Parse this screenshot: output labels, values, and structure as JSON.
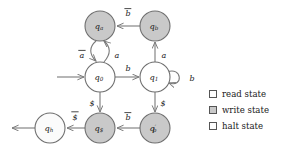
{
  "diagram": {
    "type": "state-transition-diagram",
    "title": "",
    "states": [
      {
        "id": "qa",
        "label": "q",
        "sub": "a",
        "prime": "",
        "kind": "write",
        "x": 100,
        "y": 26
      },
      {
        "id": "qb",
        "label": "q",
        "sub": "b",
        "prime": "",
        "kind": "write",
        "x": 155,
        "y": 26
      },
      {
        "id": "q0",
        "label": "q",
        "sub": "0",
        "prime": "",
        "kind": "read",
        "x": 100,
        "y": 77
      },
      {
        "id": "q1",
        "label": "q",
        "sub": "1",
        "prime": "",
        "kind": "read",
        "x": 155,
        "y": 77
      },
      {
        "id": "qdollar",
        "label": "q",
        "sub": "$",
        "prime": "",
        "kind": "write",
        "x": 100,
        "y": 128
      },
      {
        "id": "qbprime",
        "label": "q",
        "sub": "b",
        "prime": "′",
        "kind": "write",
        "x": 155,
        "y": 128
      },
      {
        "id": "qh",
        "label": "q",
        "sub": "h",
        "prime": "",
        "kind": "halt",
        "x": 50,
        "y": 128
      }
    ],
    "transitions": [
      {
        "from": "qb",
        "to": "qa",
        "label": "b",
        "overline": true,
        "lx": 128,
        "ly": 13
      },
      {
        "from": "q0",
        "to": "qa",
        "label": "a",
        "overline": false,
        "lx": 115,
        "ly": 55
      },
      {
        "from": "qa",
        "to": "q0",
        "label": "a",
        "overline": true,
        "lx": 84,
        "ly": 55
      },
      {
        "from": "q1",
        "to": "qb",
        "label": "a",
        "overline": false,
        "lx": 164,
        "ly": 55
      },
      {
        "from": "q0",
        "to": "q1",
        "label": "b",
        "overline": false,
        "lx": 128,
        "ly": 70
      },
      {
        "from": "q1",
        "to": "q1",
        "label": "b",
        "overline": false,
        "lx": 190,
        "ly": 79
      },
      {
        "from": "q0",
        "to": "qdollar",
        "label": "$",
        "overline": false,
        "lx": 93,
        "ly": 106
      },
      {
        "from": "q1",
        "to": "qbprime",
        "label": "$",
        "overline": false,
        "lx": 163,
        "ly": 106
      },
      {
        "from": "qbprime",
        "to": "qdollar",
        "label": "b",
        "overline": true,
        "lx": 128,
        "ly": 118
      },
      {
        "from": "qdollar",
        "to": "qh",
        "label": "$",
        "overline": true,
        "lx": 75,
        "ly": 118
      }
    ],
    "start_arrow": {
      "target": "q0",
      "label": ""
    },
    "exit_arrow": {
      "source": "qh",
      "label": ""
    }
  },
  "legend": {
    "items": [
      {
        "key": "read",
        "label": "read state",
        "color": "#ffffff"
      },
      {
        "key": "write",
        "label": "write state",
        "color": "#c9c9c9"
      },
      {
        "key": "halt",
        "label": "halt state",
        "color": "#fdfdfd"
      }
    ]
  },
  "colors": {
    "node_stroke": "#6f6f6f",
    "edge_stroke": "#7a7a7a",
    "text": "#1a1a1a",
    "write_fill": "#c9c9c9",
    "read_fill": "#ffffff",
    "halt_fill": "#fbfbfb",
    "background": "#ffffff"
  }
}
